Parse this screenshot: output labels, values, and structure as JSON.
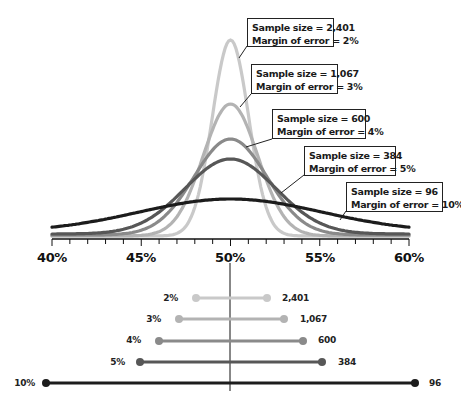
{
  "chart_data": {
    "type": "line",
    "title": "",
    "xlabel": "",
    "ylabel": "",
    "x_range": [
      40,
      60
    ],
    "x_ticks": [
      "40%",
      "45%",
      "50%",
      "55%",
      "60%"
    ],
    "minor_tick_step": 1,
    "grid": false,
    "center": 50,
    "series": [
      {
        "name": "Sample size = 2,401 / Margin of error = 2%",
        "sample_size": "2,401",
        "margin_of_error": "2%",
        "moe_value": 2,
        "color": "#c9c9c9",
        "peak_y": 40
      },
      {
        "name": "Sample size = 1,067 / Margin of error = 3%",
        "sample_size": "1,067",
        "margin_of_error": "3%",
        "moe_value": 3,
        "color": "#b3b3b3",
        "peak_y": 104
      },
      {
        "name": "Sample size = 600 / Margin of error = 4%",
        "sample_size": "600",
        "margin_of_error": "4%",
        "moe_value": 4,
        "color": "#8a8a8a",
        "peak_y": 139
      },
      {
        "name": "Sample size = 384 / Margin of error = 5%",
        "sample_size": "384",
        "margin_of_error": "5%",
        "moe_value": 5,
        "color": "#575757",
        "peak_y": 159
      },
      {
        "name": "Sample size = 96 / Margin of error = 10%",
        "sample_size": "96",
        "margin_of_error": "10%",
        "moe_value": 10,
        "color": "#1c1c1c",
        "peak_y": 199
      }
    ],
    "annotations": [
      {
        "line1": "Sample size = 2,401",
        "line2": "Margin of error = 2%"
      },
      {
        "line1": "Sample size = 1,067",
        "line2": "Margin of error = 3%"
      },
      {
        "line1": "Sample size = 600",
        "line2": "Margin of error = 4%"
      },
      {
        "line1": "Sample size = 384",
        "line2": "Margin of error = 5%"
      },
      {
        "line1": "Sample size = 96",
        "line2": "Margin of error = 10%"
      }
    ],
    "interval_bars": [
      {
        "moe_label": "2%",
        "n_label": "2,401",
        "low": 48,
        "high": 52
      },
      {
        "moe_label": "3%",
        "n_label": "1,067",
        "low": 47,
        "high": 53
      },
      {
        "moe_label": "4%",
        "n_label": "600",
        "low": 46,
        "high": 54
      },
      {
        "moe_label": "5%",
        "n_label": "384",
        "low": 45,
        "high": 55
      },
      {
        "moe_label": "10%",
        "n_label": "96",
        "low": 40,
        "high": 60
      }
    ]
  }
}
